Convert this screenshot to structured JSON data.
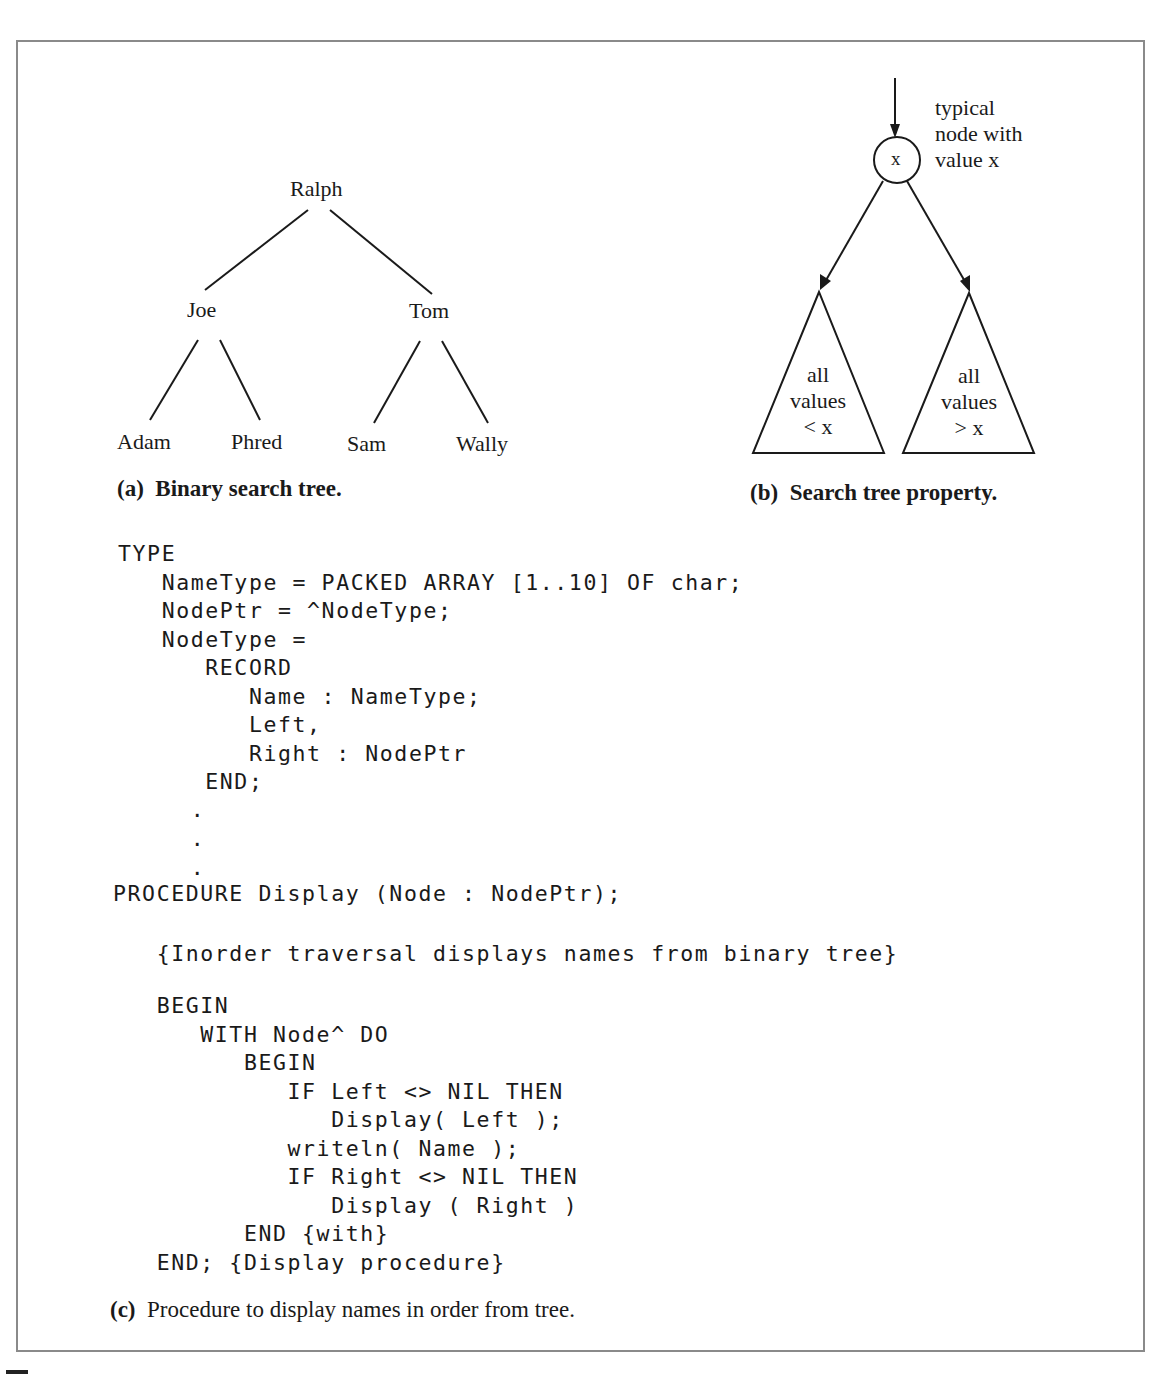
{
  "figure_a": {
    "nodes": {
      "root": "Ralph",
      "left": "Joe",
      "right": "Tom",
      "left_left": "Adam",
      "left_right": "Phred",
      "right_left": "Sam",
      "right_right": "Wally"
    },
    "caption_tag": "(a)",
    "caption_text": "Binary search tree."
  },
  "figure_b": {
    "node_value": "x",
    "annotation": [
      "typical",
      "node with",
      "value x"
    ],
    "left_subtree": [
      "all",
      "values",
      "< x"
    ],
    "right_subtree": [
      "all",
      "values",
      "> x"
    ],
    "caption_tag": "(b)",
    "caption_text": "Search tree property."
  },
  "figure_c": {
    "code_lines": [
      "TYPE",
      "   NameType = PACKED ARRAY [1..10] OF char;",
      "   NodePtr = ^NodeType;",
      "   NodeType =",
      "      RECORD",
      "         Name : NameType;",
      "         Left,",
      "         Right : NodePtr",
      "      END;",
      "     .",
      "     .",
      "     .",
      "PROCEDURE Display (Node : NodePtr);",
      "",
      "   {Inorder traversal displays names from binary tree}",
      "",
      "   BEGIN",
      "      WITH Node^ DO",
      "         BEGIN",
      "            IF Left <> NIL THEN",
      "               Display( Left );",
      "            writeln( Name );",
      "            IF Right <> NIL THEN",
      "               Display ( Right )",
      "         END {with}",
      "   END; {Display procedure}"
    ],
    "caption_tag": "(c)",
    "caption_text": "Procedure to display names in order from tree."
  }
}
